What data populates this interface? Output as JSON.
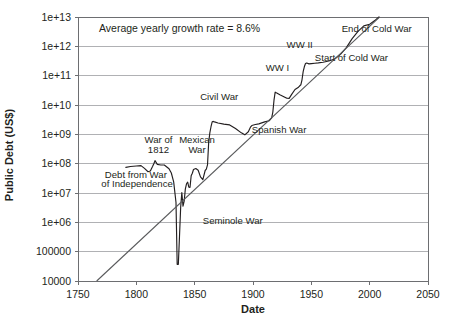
{
  "chart_data": {
    "type": "line",
    "title": "",
    "xlabel": "Date",
    "ylabel": "Public Debt (US$)",
    "xlim": [
      1750,
      2050
    ],
    "ylim": [
      10000,
      10000000000000.0
    ],
    "yscale": "log",
    "grid": true,
    "legend": "none",
    "xticks": [
      1750,
      1800,
      1850,
      1900,
      1950,
      2000,
      2050
    ],
    "xticklabels": [
      "1750",
      "1800",
      "1850",
      "1900",
      "1950",
      "2000",
      "2050"
    ],
    "yticks": [
      10000,
      100000,
      1000000,
      10000000,
      100000000,
      1000000000,
      10000000000,
      100000000000,
      1000000000000,
      10000000000000
    ],
    "yticklabels": [
      "10000",
      "100000",
      "1e+06",
      "1e+07",
      "1e+08",
      "1e+09",
      "1e+10",
      "1e+11",
      "1e+12",
      "1e+13"
    ],
    "series": [
      {
        "name": "US Public Debt",
        "color": "#231f20",
        "points": [
          [
            1791,
            75000000
          ],
          [
            1795,
            80000000
          ],
          [
            1800,
            83000000
          ],
          [
            1804,
            86000000
          ],
          [
            1807,
            69000000
          ],
          [
            1810,
            53000000
          ],
          [
            1812,
            56000000
          ],
          [
            1814,
            81000000
          ],
          [
            1815,
            99000000
          ],
          [
            1816,
            127000000
          ],
          [
            1818,
            95000000
          ],
          [
            1821,
            90000000
          ],
          [
            1824,
            90000000
          ],
          [
            1828,
            67000000
          ],
          [
            1830,
            48000000
          ],
          [
            1832,
            24000000
          ],
          [
            1834,
            4760000
          ],
          [
            1835,
            37000
          ],
          [
            1836,
            37000
          ],
          [
            1837,
            336000
          ],
          [
            1838,
            3300000
          ],
          [
            1839,
            10400000
          ],
          [
            1840,
            3570000
          ],
          [
            1841,
            5250000
          ],
          [
            1842,
            13590000
          ],
          [
            1843,
            20600000
          ],
          [
            1844,
            23460000
          ],
          [
            1845,
            15900000
          ],
          [
            1846,
            15550000
          ],
          [
            1847,
            38820000
          ],
          [
            1848,
            47040000
          ],
          [
            1849,
            63060000
          ],
          [
            1851,
            68300000
          ],
          [
            1853,
            59800000
          ],
          [
            1855,
            35580000
          ],
          [
            1857,
            28700000
          ],
          [
            1859,
            58490000
          ],
          [
            1860,
            64840000
          ],
          [
            1861,
            90580000
          ],
          [
            1862,
            524000000
          ],
          [
            1863,
            1119000000
          ],
          [
            1864,
            1815000000
          ],
          [
            1865,
            2677000000
          ],
          [
            1866,
            2755000000
          ],
          [
            1867,
            2650000000
          ],
          [
            1870,
            2436000000
          ],
          [
            1875,
            2232000000
          ],
          [
            1880,
            2090000000
          ],
          [
            1885,
            1578000000
          ],
          [
            1890,
            1122000000
          ],
          [
            1893,
            961000000
          ],
          [
            1896,
            1222000000
          ],
          [
            1898,
            1796000000
          ],
          [
            1899,
            1991000000
          ],
          [
            1902,
            2158000000
          ],
          [
            1905,
            2274000000
          ],
          [
            1910,
            2652000000
          ],
          [
            1914,
            2912000000
          ],
          [
            1916,
            3609000000
          ],
          [
            1917,
            5717000000
          ],
          [
            1918,
            14592000000
          ],
          [
            1919,
            27390000000
          ],
          [
            1920,
            25952000000
          ],
          [
            1923,
            22350000000
          ],
          [
            1926,
            19643000000
          ],
          [
            1929,
            16931000000
          ],
          [
            1931,
            16801000000
          ],
          [
            1933,
            22539000000
          ],
          [
            1936,
            33779000000
          ],
          [
            1939,
            40440000000
          ],
          [
            1941,
            48961000000
          ],
          [
            1942,
            72422000000
          ],
          [
            1943,
            136696000000
          ],
          [
            1944,
            201003000000
          ],
          [
            1945,
            258682000000
          ],
          [
            1946,
            269422000000
          ],
          [
            1948,
            252292000000
          ],
          [
            1950,
            257357000000
          ],
          [
            1953,
            266071000000
          ],
          [
            1956,
            272751000000
          ],
          [
            1960,
            286331000000
          ],
          [
            1965,
            317274000000
          ],
          [
            1970,
            370919000000
          ],
          [
            1975,
            533189000000
          ],
          [
            1980,
            907701000000
          ],
          [
            1985,
            1823103000000
          ],
          [
            1990,
            3233313000000
          ],
          [
            1995,
            4973983000000
          ],
          [
            2000,
            5674178000000
          ],
          [
            2005,
            7932710000000
          ],
          [
            2008,
            10024725000000
          ]
        ]
      },
      {
        "name": "Average growth trend (8.6% per year)",
        "color": "#58595b",
        "points": [
          [
            1766,
            10000
          ],
          [
            2008,
            9500000000000
          ]
        ]
      }
    ],
    "annotations": [
      {
        "id": "growth-rate-note",
        "text": "Average yearly growth rate = 8.6%",
        "x": 1768,
        "y": 3100000000000.0,
        "anchor": "start",
        "size": "large"
      },
      {
        "id": "debt-war-independence",
        "text": "Debt from War",
        "x": 1773,
        "y": 32000000.0,
        "anchor": "start",
        "size": "small"
      },
      {
        "id": "debt-war-independence-2",
        "text": "of Independence",
        "x": 1770,
        "y": 15500000.0,
        "anchor": "start",
        "size": "small"
      },
      {
        "id": "war-of-1812",
        "text": "War of",
        "x": 1819,
        "y": 500000000.0,
        "anchor": "middle",
        "size": "small"
      },
      {
        "id": "war-of-1812-2",
        "text": "1812",
        "x": 1819,
        "y": 240000000.0,
        "anchor": "middle",
        "size": "small"
      },
      {
        "id": "mexican-war",
        "text": "Mexican",
        "x": 1852,
        "y": 500000000.0,
        "anchor": "middle",
        "size": "small"
      },
      {
        "id": "mexican-war-2",
        "text": "War",
        "x": 1852,
        "y": 240000000.0,
        "anchor": "middle",
        "size": "small"
      },
      {
        "id": "seminole-war",
        "text": "Seminole War",
        "x": 1857,
        "y": 900000.0,
        "anchor": "start",
        "size": "small"
      },
      {
        "id": "civil-war",
        "text": "Civil War",
        "x": 1871,
        "y": 14500000000.0,
        "anchor": "middle",
        "size": "small"
      },
      {
        "id": "spanish-war",
        "text": "Spanish War",
        "x": 1899,
        "y": 1100000000.0,
        "anchor": "start",
        "size": "small"
      },
      {
        "id": "ww-i",
        "text": "WW I",
        "x": 1921,
        "y": 145000000000.0,
        "anchor": "middle",
        "size": "small"
      },
      {
        "id": "ww-ii",
        "text": "WW II",
        "x": 1940,
        "y": 900000000000.0,
        "anchor": "middle",
        "size": "small"
      },
      {
        "id": "start-cold-war",
        "text": "Start of Cold War",
        "x": 1953,
        "y": 320000000000.0,
        "anchor": "start",
        "size": "small"
      },
      {
        "id": "end-cold-war",
        "text": "End of Cold War",
        "x": 1976,
        "y": 3200000000000.0,
        "anchor": "start",
        "size": "small"
      }
    ]
  }
}
